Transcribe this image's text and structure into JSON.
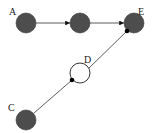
{
  "diagram": {
    "type": "directed-graph",
    "nodes": [
      {
        "id": "A",
        "label": "A",
        "style": "filled"
      },
      {
        "id": "B",
        "label": "",
        "style": "filled"
      },
      {
        "id": "E",
        "label": "E",
        "style": "filled"
      },
      {
        "id": "D",
        "label": "D",
        "style": "open"
      },
      {
        "id": "C",
        "label": "C",
        "style": "filled"
      }
    ],
    "edges": [
      {
        "from": "A",
        "to": "B",
        "style": "arrow"
      },
      {
        "from": "B",
        "to": "E",
        "style": "arrow"
      },
      {
        "from": "C",
        "to": "D",
        "style": "dot-end"
      },
      {
        "from": "D",
        "to": "E",
        "style": "dot-end"
      }
    ],
    "colors": {
      "node_fill": "#4d4d4d",
      "edge": "#333333",
      "background": "#ffffff"
    }
  }
}
